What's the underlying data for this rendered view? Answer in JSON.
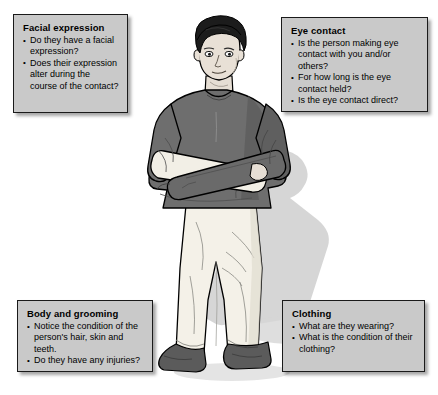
{
  "page": {
    "background_color": "#ffffff",
    "width": 438,
    "height": 395
  },
  "illustration": {
    "name": "standing-person-arms-crossed",
    "description": "Line-art illustration of a person standing facing forward with arms crossed over the chest, casting a soft grey shadow to the right",
    "colors": {
      "hair": "#1c1c1c",
      "skin": "#e8e0d8",
      "shirt": "#6e6e6e",
      "trousers": "#f2efe6",
      "shoes": "#575757",
      "outline": "#000000",
      "shadow": "#cccccc"
    }
  },
  "boxes": {
    "facial_expression": {
      "title": "Facial expression",
      "items": [
        "Do they have a facial expression?",
        "Does their expression alter during the course of the contact?"
      ]
    },
    "eye_contact": {
      "title": "Eye contact",
      "items": [
        "Is the person making eye contact with you and/or others?",
        "For how long is the eye contact held?",
        "Is the eye contact direct?"
      ]
    },
    "body_and_grooming": {
      "title": "Body and grooming",
      "items": [
        "Notice the condition of the person's hair, skin and teeth.",
        "Do they have any injuries?"
      ]
    },
    "clothing": {
      "title": "Clothing",
      "items": [
        "What are they wearing?",
        "What is the condition of their clothing?"
      ]
    }
  },
  "theme": {
    "box_fill": "#c9c9c9",
    "box_border": "#1a1a1a",
    "text_color": "#000000"
  }
}
